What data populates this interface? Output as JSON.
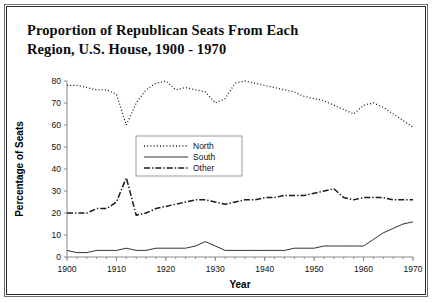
{
  "title": {
    "line1": "Proportion of Republican Seats From Each",
    "line2": "Region, U.S. House, 1900 - 1970"
  },
  "chart_data": {
    "type": "line",
    "title": "Proportion of Republican Seats From Each Region, U.S. House, 1900 - 1970",
    "xlabel": "Year",
    "ylabel": "Percentage of Seats",
    "xlim": [
      1900,
      1970
    ],
    "ylim": [
      0,
      80
    ],
    "xticks": [
      1900,
      1910,
      1920,
      1930,
      1940,
      1950,
      1960,
      1970
    ],
    "yticks": [
      0,
      10,
      20,
      30,
      40,
      50,
      60,
      70,
      80
    ],
    "grid": false,
    "legend_position": "center",
    "x": [
      1900,
      1902,
      1904,
      1906,
      1908,
      1910,
      1912,
      1914,
      1916,
      1918,
      1920,
      1922,
      1924,
      1926,
      1928,
      1930,
      1932,
      1934,
      1936,
      1938,
      1940,
      1942,
      1944,
      1946,
      1948,
      1950,
      1952,
      1954,
      1956,
      1958,
      1960,
      1962,
      1964,
      1966,
      1968,
      1970
    ],
    "series": [
      {
        "name": "North",
        "style": "dotted",
        "values": [
          78,
          78,
          77,
          76,
          76,
          74,
          60,
          70,
          76,
          79,
          80,
          76,
          77,
          76,
          75,
          70,
          72,
          79,
          80,
          79,
          78,
          77,
          76,
          75,
          73,
          72,
          71,
          69,
          67,
          65,
          69,
          70,
          68,
          65,
          62,
          59
        ]
      },
      {
        "name": "South",
        "style": "solid",
        "values": [
          3,
          2,
          2,
          3,
          3,
          3,
          4,
          3,
          3,
          4,
          4,
          4,
          4,
          5,
          7,
          5,
          3,
          3,
          3,
          3,
          3,
          3,
          3,
          4,
          4,
          4,
          5,
          5,
          5,
          5,
          5,
          8,
          11,
          13,
          15,
          16
        ]
      },
      {
        "name": "Other",
        "style": "dashdot",
        "values": [
          20,
          20,
          20,
          22,
          22,
          25,
          36,
          19,
          20,
          22,
          23,
          24,
          25,
          26,
          26,
          25,
          24,
          25,
          26,
          26,
          27,
          27,
          28,
          28,
          28,
          29,
          30,
          31,
          27,
          26,
          27,
          27,
          27,
          26,
          26,
          26
        ]
      }
    ]
  },
  "legend": {
    "items": [
      {
        "label": "North"
      },
      {
        "label": "South"
      },
      {
        "label": "Other"
      }
    ]
  }
}
